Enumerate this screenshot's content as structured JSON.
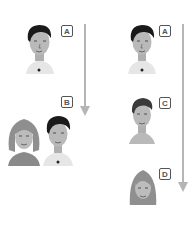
{
  "diagram": {
    "left_column": {
      "top_person": {
        "label": "A",
        "type": "man"
      },
      "bottom_group": {
        "label": "B",
        "people": [
          "woman",
          "man"
        ]
      },
      "arrow": {
        "direction": "down"
      }
    },
    "right_column": {
      "persons": [
        {
          "label": "A",
          "type": "man"
        },
        {
          "label": "C",
          "type": "boy"
        },
        {
          "label": "D",
          "type": "woman"
        }
      ],
      "arrow": {
        "direction": "down"
      }
    },
    "colors": {
      "arrow": "#b5b5b5",
      "label_border": "#555555",
      "skin": "#b9b9b9",
      "hair_dark": "#1a1a1a",
      "hair_light": "#8f8f8f"
    }
  }
}
